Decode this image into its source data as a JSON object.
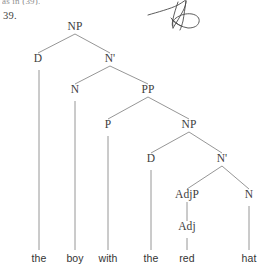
{
  "page": {
    "cutoff_header_text": "as in (39).",
    "example_number": "39.",
    "background_color": "#ffffff",
    "ink_color": "#3d3d3d",
    "line_color": "#8a8a8a",
    "width": 271,
    "height": 270
  },
  "tree": {
    "title": "syntax tree for the noun phrase",
    "sentence": "the boy with the red hat",
    "nodes": [
      {
        "id": "np-root",
        "label": "NP",
        "x": 75,
        "y": 30
      },
      {
        "id": "d-1",
        "label": "D",
        "x": 38,
        "y": 62
      },
      {
        "id": "nbar-1",
        "label": "N'",
        "x": 110,
        "y": 62
      },
      {
        "id": "n-1",
        "label": "N",
        "x": 75,
        "y": 93
      },
      {
        "id": "pp-1",
        "label": "PP",
        "x": 148,
        "y": 93
      },
      {
        "id": "p-1",
        "label": "P",
        "x": 108,
        "y": 128
      },
      {
        "id": "np-2",
        "label": "NP",
        "x": 189,
        "y": 128
      },
      {
        "id": "d-2",
        "label": "D",
        "x": 151,
        "y": 162
      },
      {
        "id": "nbar-2",
        "label": "N'",
        "x": 222,
        "y": 162
      },
      {
        "id": "adjp-1",
        "label": "AdjP",
        "x": 187,
        "y": 198
      },
      {
        "id": "n-2",
        "label": "N",
        "x": 249,
        "y": 198
      },
      {
        "id": "adj-1",
        "label": "Adj",
        "x": 187,
        "y": 230
      }
    ],
    "edges": [
      {
        "from": "np-root",
        "to": "d-1"
      },
      {
        "from": "np-root",
        "to": "nbar-1"
      },
      {
        "from": "nbar-1",
        "to": "n-1"
      },
      {
        "from": "nbar-1",
        "to": "pp-1"
      },
      {
        "from": "pp-1",
        "to": "p-1"
      },
      {
        "from": "pp-1",
        "to": "np-2"
      },
      {
        "from": "np-2",
        "to": "d-2"
      },
      {
        "from": "np-2",
        "to": "nbar-2"
      },
      {
        "from": "nbar-2",
        "to": "adjp-1"
      },
      {
        "from": "nbar-2",
        "to": "n-2"
      },
      {
        "from": "adjp-1",
        "to": "adj-1"
      }
    ],
    "leaves": [
      {
        "id": "leaf-the-1",
        "label": "the",
        "x": 39,
        "y": 262,
        "parent": "d-1",
        "stem_top": 70
      },
      {
        "id": "leaf-boy",
        "label": "boy",
        "x": 75,
        "y": 262,
        "parent": "n-1",
        "stem_top": 101
      },
      {
        "id": "leaf-with",
        "label": "with",
        "x": 108,
        "y": 262,
        "parent": "p-1",
        "stem_top": 136
      },
      {
        "id": "leaf-the-2",
        "label": "the",
        "x": 151,
        "y": 262,
        "parent": "d-2",
        "stem_top": 170
      },
      {
        "id": "leaf-red",
        "label": "red",
        "x": 187,
        "y": 262,
        "parent": "adj-1",
        "stem_top": 238
      },
      {
        "id": "leaf-hat",
        "label": "hat",
        "x": 249,
        "y": 262,
        "parent": "n-2",
        "stem_top": 206
      }
    ]
  },
  "annotation": {
    "type": "handwritten-scribble",
    "description": "pen scribble mark",
    "color": "#4a4a4a"
  }
}
